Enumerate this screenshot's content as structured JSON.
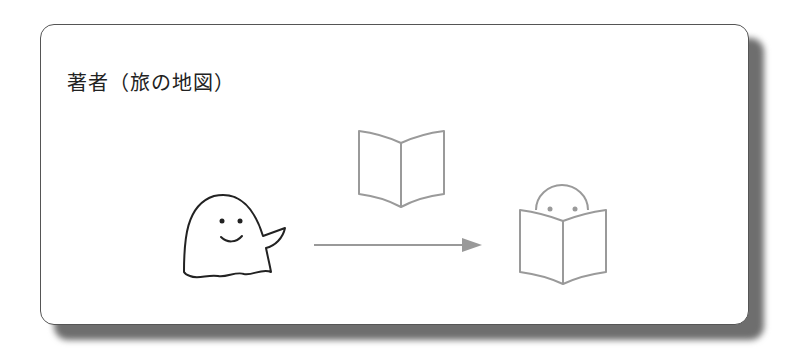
{
  "card": {
    "title": "著者（旅の地図）"
  },
  "figures": {
    "author": "ghost-character",
    "book_floating": "open-book",
    "reader": "reader-behind-book",
    "arrow": "right-arrow"
  },
  "colors": {
    "border": "#555555",
    "shadow": "#6e6e6e",
    "line": "#222222",
    "gray_line": "#999999"
  }
}
